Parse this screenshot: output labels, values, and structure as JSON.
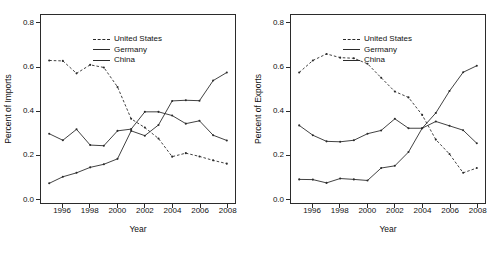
{
  "chart_data": [
    {
      "type": "line",
      "title": "",
      "xlabel": "Year",
      "ylabel": "Percent of Imports",
      "xlim": [
        1994.4,
        2008.6
      ],
      "ylim": [
        -0.02,
        0.84
      ],
      "xticks": [
        1996,
        1998,
        2000,
        2002,
        2004,
        2006,
        2008
      ],
      "yticks": [
        0.0,
        0.2,
        0.4,
        0.6,
        0.8
      ],
      "ytick_labels": [
        "0.0",
        "0.2",
        "0.4",
        "0.6",
        "0.8"
      ],
      "xtick_labels": [
        "1996",
        "1998",
        "2000",
        "2002",
        "2004",
        "2006",
        "2008"
      ],
      "grid": false,
      "legend_position": "top-left",
      "x": [
        1995,
        1996,
        1997,
        1998,
        1999,
        2000,
        2001,
        2002,
        2003,
        2004,
        2005,
        2006,
        2007,
        2008
      ],
      "series": [
        {
          "name": "United States",
          "style": "dashed",
          "color": "#2b2b2b",
          "values": [
            0.632,
            0.63,
            0.573,
            0.612,
            0.6,
            0.511,
            0.365,
            0.325,
            0.275,
            0.192,
            0.208,
            0.193,
            0.175,
            0.16
          ]
        },
        {
          "name": "Germany",
          "style": "solid",
          "color": "#2b2b2b",
          "values": [
            0.297,
            0.267,
            0.317,
            0.245,
            0.242,
            0.31,
            0.318,
            0.397,
            0.397,
            0.38,
            0.343,
            0.356,
            0.29,
            0.266
          ]
        },
        {
          "name": "China",
          "style": "solid",
          "color": "#2b2b2b",
          "values": [
            0.07,
            0.1,
            0.118,
            0.143,
            0.157,
            0.182,
            0.31,
            0.288,
            0.337,
            0.447,
            0.45,
            0.448,
            0.54,
            0.577
          ]
        }
      ]
    },
    {
      "type": "line",
      "title": "",
      "xlabel": "Year",
      "ylabel": "Percent of Exports",
      "xlim": [
        1994.4,
        2008.6
      ],
      "ylim": [
        -0.02,
        0.84
      ],
      "xticks": [
        1996,
        1998,
        2000,
        2002,
        2004,
        2006,
        2008
      ],
      "yticks": [
        0.0,
        0.2,
        0.4,
        0.6,
        0.8
      ],
      "ytick_labels": [
        "0.0",
        "0.2",
        "0.4",
        "0.6",
        "0.8"
      ],
      "xtick_labels": [
        "1996",
        "1998",
        "2000",
        "2002",
        "2004",
        "2006",
        "2008"
      ],
      "grid": false,
      "legend_position": "top-left",
      "x": [
        1995,
        1996,
        1997,
        1998,
        1999,
        2000,
        2001,
        2002,
        2003,
        2004,
        2005,
        2006,
        2007,
        2008
      ],
      "series": [
        {
          "name": "United States",
          "style": "dashed",
          "color": "#2b2b2b",
          "values": [
            0.577,
            0.632,
            0.662,
            0.645,
            0.642,
            0.617,
            0.553,
            0.49,
            0.463,
            0.383,
            0.27,
            0.204,
            0.118,
            0.14
          ]
        },
        {
          "name": "Germany",
          "style": "solid",
          "color": "#2b2b2b",
          "values": [
            0.335,
            0.29,
            0.262,
            0.26,
            0.267,
            0.297,
            0.312,
            0.365,
            0.322,
            0.322,
            0.353,
            0.333,
            0.313,
            0.253
          ]
        },
        {
          "name": "China",
          "style": "solid",
          "color": "#2b2b2b",
          "values": [
            0.088,
            0.087,
            0.072,
            0.092,
            0.088,
            0.083,
            0.14,
            0.15,
            0.213,
            0.322,
            0.392,
            0.492,
            0.578,
            0.608
          ]
        }
      ]
    }
  ],
  "panels": [
    {
      "id": "imports",
      "ylabel": "Percent of Imports",
      "xlabel": "Year",
      "legend": [
        {
          "label": "United States",
          "style": "dashed"
        },
        {
          "label": "Germany",
          "style": "solid"
        },
        {
          "label": "China",
          "style": "solid"
        }
      ],
      "ytick_labels": [
        "0.8",
        "0.6",
        "0.4",
        "0.2",
        "0.0"
      ],
      "xtick_labels": [
        "1996",
        "1998",
        "2000",
        "2002",
        "2004",
        "2006",
        "2008"
      ]
    },
    {
      "id": "exports",
      "ylabel": "Percent of Exports",
      "xlabel": "Year",
      "legend": [
        {
          "label": "United States",
          "style": "dashed"
        },
        {
          "label": "Germany",
          "style": "solid"
        },
        {
          "label": "China",
          "style": "solid"
        }
      ],
      "ytick_labels": [
        "0.8",
        "0.6",
        "0.4",
        "0.2",
        "0.0"
      ],
      "xtick_labels": [
        "1996",
        "1998",
        "2000",
        "2002",
        "2004",
        "2006",
        "2008"
      ]
    }
  ]
}
